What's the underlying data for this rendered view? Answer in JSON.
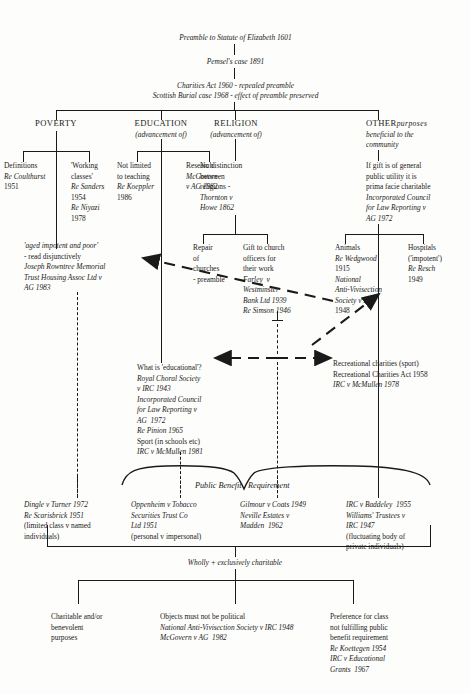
{
  "diagram": {
    "root": {
      "line1": "Preamble to Statute of Elizabeth 1601",
      "line2": "Pemsel's case 1891",
      "line3": "Charities Act 1960 - repealed preamble",
      "line4": "Scottish Burial case 1968 - effect of preamble preserved"
    },
    "heads": [
      {
        "name": "POVERTY",
        "sub": ""
      },
      {
        "name": "EDUCATION",
        "sub": "(advancement of)"
      },
      {
        "name": "RELIGION",
        "sub": "(advancement of)"
      },
      {
        "name": "OTHER",
        "sub": "purposes",
        "sub2": "beneficial to the",
        "sub3": "community"
      }
    ],
    "poverty": {
      "definitions": [
        "Definitions",
        "Re Coulthurst",
        "1951"
      ],
      "working_classes": [
        "'Working",
        "classes'",
        "Re Sanders",
        "1954",
        "Re Niyazi",
        "1978"
      ],
      "aged": [
        "'aged impotent and poor'",
        "- read disjunctively",
        "Joseph Rowntree Memorial",
        "Trust Housing Assoc Ltd v",
        "AG 1983"
      ]
    },
    "education": {
      "not_limited": [
        "Not limited",
        "to teaching",
        "Re Koeppler",
        "1986"
      ],
      "research": [
        "Research",
        "McGovern",
        "v AG 1982"
      ],
      "what_is_educational": [
        "What is 'educational'?",
        "Royal Choral Society",
        "v IRC 1943",
        "Incorporated Council",
        "for Law Reporting v",
        "AG  1972",
        "Re Pinion 1965",
        "Sport (in schools etc)",
        "IRC v McMullen 1981"
      ]
    },
    "religion": {
      "no_distinction": [
        "No distinction",
        "between",
        "religions -",
        "Thornton v",
        "Howe 1862"
      ],
      "repair": [
        "Repair",
        "of",
        "churches",
        "- preamble"
      ],
      "gift_officers": [
        "Gift to church",
        "officers for",
        "their work",
        "Farley  v",
        "Westminster",
        "Bank Ltd 1939",
        "Re Simson 1946"
      ]
    },
    "other": {
      "general_utility": [
        "If gift is of general",
        "public utility it is",
        "prima facie charitable",
        "Incorporated Council",
        "for Law Reporting v",
        "AG 1972"
      ],
      "animals": [
        "Animals",
        "Re Wedgwood",
        "1915",
        "National",
        "Anti-Vivisection",
        "Society v IRC",
        "1948"
      ],
      "hospitals": [
        "Hospitals",
        "('impotent')",
        "Re Resch",
        "1949"
      ],
      "recreational": [
        "Recreational charities (sport)",
        "Recreational Charities Act 1958",
        "IRC v McMullen 1978"
      ]
    },
    "public_benefit": {
      "label_a": "Public Benefit",
      "label_b": "Requirement",
      "cases": [
        [
          "Dingle v Turner 1972",
          "Re Scarisbrick 1951",
          "(limited class v named",
          "individuals)"
        ],
        [
          "Oppenheim v Tobacco",
          "Securities Trust Co",
          "Ltd 1951",
          "(personal v impersonal)"
        ],
        [
          "Gilmour v Coats 1949",
          "Neville Estates v",
          "Madden  1962"
        ],
        [
          "IRC v Baddeley  1955",
          "Williams' Trustees v",
          "IRC 1947",
          "(fluctuating body of",
          "private individuals)"
        ]
      ]
    },
    "wholly": {
      "label": "Wholly + exclusively charitable",
      "branches": [
        [
          "Charitable and/or",
          "benevolent",
          "purposes"
        ],
        [
          "Objects must not be political",
          "National Anti-Vivisection Society v IRC 1948",
          "McGovern v AG  1982"
        ],
        [
          "Preference for class",
          "not fulfilling public",
          "benefit requirement",
          "Re Koettegen 1954",
          "IRC v Educational",
          "Grants  1967"
        ]
      ]
    },
    "colors": {
      "ink": "#1a1a1a",
      "paper": "#fdfdfb"
    }
  }
}
